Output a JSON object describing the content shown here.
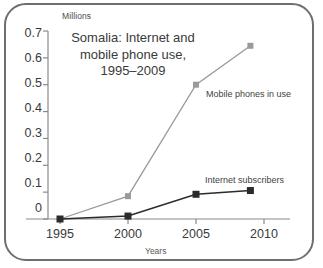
{
  "chart_data": {
    "type": "line",
    "title": "Somalia: Internet and mobile phone use, 1995–2009",
    "title_lines": [
      "Somalia: Internet and",
      "mobile phone use,",
      "1995–2009"
    ],
    "xlabel": "Years",
    "ylabel": "Millions",
    "y_unit_label": "Millions",
    "x": [
      1995,
      2000,
      2005,
      2009
    ],
    "xlim": [
      1993.5,
      2011.5
    ],
    "ylim": [
      0,
      0.7
    ],
    "xticks": [
      1995,
      2000,
      2005,
      2010
    ],
    "xtick_labels": [
      "1995",
      "2000",
      "2005",
      "2010"
    ],
    "yticks": [
      0,
      0.1,
      0.2,
      0.3,
      0.4,
      0.5,
      0.6,
      0.7
    ],
    "ytick_labels": [
      "0",
      "0.1",
      "0.2",
      "0.3",
      "0.4",
      "0.5",
      "0.6",
      "0.7"
    ],
    "grid": false,
    "legend_position": "inline-annotation",
    "series": [
      {
        "name": "Mobile phones in use",
        "color": "#9a9a9a",
        "marker": "square",
        "values": [
          0.0,
          0.085,
          0.5,
          0.645
        ]
      },
      {
        "name": "Internet subscribers",
        "color": "#2b2b2b",
        "marker": "square",
        "values": [
          0.0,
          0.011,
          0.092,
          0.106
        ]
      }
    ],
    "annotations": [
      {
        "text": "Mobile phones in use",
        "x": 2005.4,
        "y": 0.495
      },
      {
        "text": "Internet subscribers",
        "x": 2004.1,
        "y": 0.155
      }
    ]
  },
  "style": {
    "frame_border_color": "#6e6e6e",
    "background_color": "#ffffff",
    "axis_color": "#8a8a8a",
    "text_color": "#3a3a3a"
  }
}
